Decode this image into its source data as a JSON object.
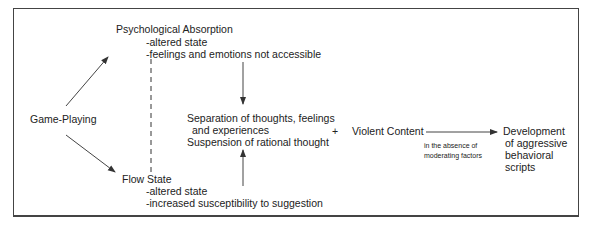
{
  "diagram": {
    "nodes": {
      "game_playing": "Game-Playing",
      "psych_absorption": {
        "title": "Psychological Absorption",
        "points": [
          "-altered state",
          "-feelings and emotions not accessible"
        ]
      },
      "flow_state": {
        "title": "Flow State",
        "points": [
          "-altered state",
          "-increased susceptibility to suggestion"
        ]
      },
      "separation": {
        "line1": "Separation of thoughts, feelings",
        "line2": "and experiences",
        "line3": "Suspension of rational thought"
      },
      "plus": "+",
      "violent_content": "Violent Content",
      "moderating": {
        "line1": "in the absence of",
        "line2": "moderating factors"
      },
      "outcome": [
        "Development",
        "of aggressive",
        "behavioral",
        "scripts"
      ]
    }
  }
}
